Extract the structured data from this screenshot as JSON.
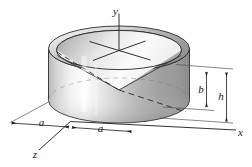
{
  "figure": {
    "name": "cylinder-with-conical-cavity",
    "background_color": "#ffffff",
    "outline_color": "#1a1a1a",
    "body_light": "#fcfcfc",
    "body_mid": "#c8c8c8",
    "body_dark": "#8f8f8f",
    "axes": {
      "y_label": "y",
      "x_label": "x",
      "z_label": "z"
    },
    "dimensions": {
      "radius_left_label": "a",
      "radius_right_label": "a",
      "cavity_depth_label": "b",
      "height_label": "h"
    }
  }
}
